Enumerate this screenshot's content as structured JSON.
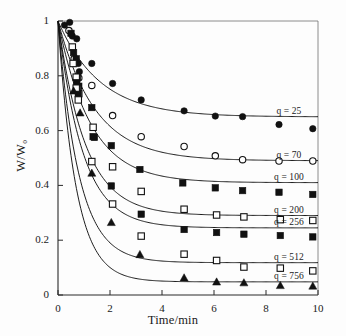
{
  "chart_data": {
    "type": "scatter",
    "title": "",
    "xlabel": "Time/min",
    "ylabel": "W/W₀",
    "xlim": [
      0,
      10
    ],
    "ylim": [
      0,
      1
    ],
    "xticks": [
      "0",
      "2",
      "4",
      "6",
      "8",
      "10"
    ],
    "xtick_values": [
      0,
      2,
      4,
      6,
      8,
      10
    ],
    "yticks": [
      "0",
      "0.2",
      "0.4",
      "0.6",
      "0.8",
      "1"
    ],
    "ytick_values": [
      0,
      0.2,
      0.4,
      0.6,
      0.8,
      1
    ],
    "grid": false,
    "legend_position": "right-inline",
    "series": [
      {
        "name": "q = 25",
        "label": "q = 25",
        "marker": "filled-circle",
        "color": "#111111",
        "plateau": 0.65,
        "rate": 0.62,
        "points": [
          {
            "x": 0.25,
            "y": 0.985
          },
          {
            "x": 0.45,
            "y": 0.995
          },
          {
            "x": 0.55,
            "y": 0.945
          },
          {
            "x": 0.72,
            "y": 0.935
          },
          {
            "x": 0.78,
            "y": 0.845
          },
          {
            "x": 0.82,
            "y": 0.815
          },
          {
            "x": 1.3,
            "y": 0.845
          },
          {
            "x": 2.1,
            "y": 0.772
          },
          {
            "x": 3.2,
            "y": 0.712
          },
          {
            "x": 4.85,
            "y": 0.672
          },
          {
            "x": 6.05,
            "y": 0.653
          },
          {
            "x": 7.1,
            "y": 0.651
          },
          {
            "x": 8.5,
            "y": 0.622
          },
          {
            "x": 9.8,
            "y": 0.607
          }
        ]
      },
      {
        "name": "q = 70",
        "label": "q = 70",
        "marker": "open-circle",
        "color": "#111111",
        "plateau": 0.49,
        "rate": 0.7,
        "points": [
          {
            "x": 0.42,
            "y": 0.965
          },
          {
            "x": 0.62,
            "y": 0.862
          },
          {
            "x": 0.8,
            "y": 0.792
          },
          {
            "x": 1.3,
            "y": 0.765
          },
          {
            "x": 2.1,
            "y": 0.655
          },
          {
            "x": 3.2,
            "y": 0.578
          },
          {
            "x": 4.85,
            "y": 0.542
          },
          {
            "x": 6.05,
            "y": 0.508
          },
          {
            "x": 7.1,
            "y": 0.494
          },
          {
            "x": 8.5,
            "y": 0.489
          },
          {
            "x": 9.8,
            "y": 0.489
          }
        ]
      },
      {
        "name": "q = 100",
        "label": "q = 100",
        "marker": "filled-square",
        "color": "#111111",
        "plateau": 0.41,
        "rate": 0.8,
        "points": [
          {
            "x": 0.5,
            "y": 0.955
          },
          {
            "x": 0.7,
            "y": 0.862
          },
          {
            "x": 0.75,
            "y": 0.795
          },
          {
            "x": 0.8,
            "y": 0.762
          },
          {
            "x": 1.3,
            "y": 0.684
          },
          {
            "x": 1.4,
            "y": 0.575
          },
          {
            "x": 2.05,
            "y": 0.545
          },
          {
            "x": 3.15,
            "y": 0.458
          },
          {
            "x": 4.8,
            "y": 0.409
          },
          {
            "x": 6.05,
            "y": 0.391
          },
          {
            "x": 7.1,
            "y": 0.381
          },
          {
            "x": 8.5,
            "y": 0.375
          },
          {
            "x": 9.8,
            "y": 0.367
          }
        ]
      },
      {
        "name": "q = 200",
        "label": "q = 200",
        "marker": "open-square",
        "color": "#111111",
        "plateau": 0.29,
        "rate": 0.95,
        "points": [
          {
            "x": 0.55,
            "y": 0.905
          },
          {
            "x": 0.7,
            "y": 0.795
          },
          {
            "x": 0.75,
            "y": 0.752
          },
          {
            "x": 0.8,
            "y": 0.735
          },
          {
            "x": 1.35,
            "y": 0.612
          },
          {
            "x": 2.1,
            "y": 0.468
          },
          {
            "x": 3.2,
            "y": 0.378
          },
          {
            "x": 4.85,
            "y": 0.313
          },
          {
            "x": 6.1,
            "y": 0.292
          },
          {
            "x": 7.15,
            "y": 0.285
          },
          {
            "x": 8.55,
            "y": 0.275
          },
          {
            "x": 9.8,
            "y": 0.272
          }
        ]
      },
      {
        "name": "q = 256",
        "label": "q = 256",
        "marker": "filled-square",
        "color": "#111111",
        "plateau": 0.245,
        "rate": 1.05,
        "points": [
          {
            "x": 0.6,
            "y": 0.885
          },
          {
            "x": 0.72,
            "y": 0.775
          },
          {
            "x": 0.78,
            "y": 0.735
          },
          {
            "x": 1.35,
            "y": 0.578
          },
          {
            "x": 2.05,
            "y": 0.398
          },
          {
            "x": 3.2,
            "y": 0.295
          },
          {
            "x": 4.85,
            "y": 0.239
          },
          {
            "x": 6.1,
            "y": 0.228
          },
          {
            "x": 7.15,
            "y": 0.222
          },
          {
            "x": 8.55,
            "y": 0.217
          },
          {
            "x": 9.8,
            "y": 0.212
          }
        ]
      },
      {
        "name": "q = 512",
        "label": "q = 512",
        "marker": "open-square",
        "color": "#111111",
        "plateau": 0.118,
        "rate": 1.25,
        "points": [
          {
            "x": 0.58,
            "y": 0.845
          },
          {
            "x": 0.7,
            "y": 0.755
          },
          {
            "x": 0.78,
            "y": 0.712
          },
          {
            "x": 1.3,
            "y": 0.487
          },
          {
            "x": 2.1,
            "y": 0.332
          },
          {
            "x": 3.2,
            "y": 0.215
          },
          {
            "x": 4.85,
            "y": 0.149
          },
          {
            "x": 6.1,
            "y": 0.126
          },
          {
            "x": 7.15,
            "y": 0.102
          },
          {
            "x": 8.55,
            "y": 0.098
          },
          {
            "x": 9.8,
            "y": 0.088
          }
        ]
      },
      {
        "name": "q = 756",
        "label": "q = 756",
        "marker": "filled-triangle",
        "color": "#111111",
        "plateau": 0.048,
        "rate": 1.45,
        "points": [
          {
            "x": 0.6,
            "y": 0.745
          },
          {
            "x": 0.85,
            "y": 0.665
          },
          {
            "x": 1.3,
            "y": 0.445
          },
          {
            "x": 2.05,
            "y": 0.265
          },
          {
            "x": 3.15,
            "y": 0.148
          },
          {
            "x": 4.85,
            "y": 0.063
          },
          {
            "x": 6.1,
            "y": 0.048
          },
          {
            "x": 7.15,
            "y": 0.045
          },
          {
            "x": 8.55,
            "y": 0.035
          },
          {
            "x": 9.8,
            "y": 0.033
          }
        ]
      }
    ]
  },
  "axes": {
    "x_title": "Time/min",
    "y_title": "W/W₀"
  }
}
